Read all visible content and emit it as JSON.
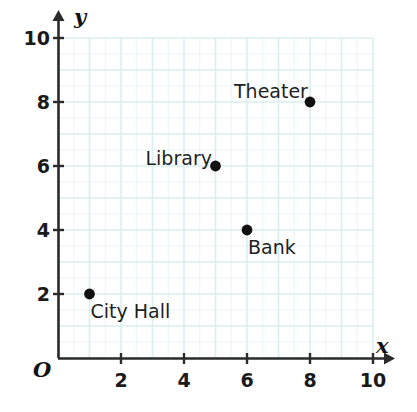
{
  "chart_data": {
    "type": "scatter",
    "title": "",
    "xlabel": "x",
    "ylabel": "y",
    "origin_label": "O",
    "xlim": [
      0,
      10
    ],
    "ylim": [
      0,
      10
    ],
    "xticks": [
      2,
      4,
      6,
      8,
      10
    ],
    "yticks": [
      2,
      4,
      6,
      8,
      10
    ],
    "xtick_labels": [
      "2",
      "4",
      "6",
      "8",
      "10"
    ],
    "ytick_labels": [
      "2",
      "4",
      "6",
      "8",
      "10"
    ],
    "grid": true,
    "grid_minor_step": 0.5,
    "grid_color": "#d9efee",
    "axis_color": "#2b2b2b",
    "point_color": "#111111",
    "legend": "none",
    "points": [
      {
        "label": "City Hall",
        "x": 1,
        "y": 2,
        "label_pos": "below-right"
      },
      {
        "label": "Library",
        "x": 5,
        "y": 6,
        "label_pos": "left"
      },
      {
        "label": "Bank",
        "x": 6,
        "y": 4,
        "label_pos": "below-right"
      },
      {
        "label": "Theater",
        "x": 8,
        "y": 8,
        "label_pos": "above-left"
      }
    ]
  },
  "figure": {
    "axis_x_label": "x",
    "axis_y_label": "y",
    "origin": "O"
  }
}
